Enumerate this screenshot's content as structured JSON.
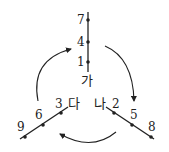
{
  "diagram": {
    "axes": [
      {
        "name": "가",
        "direction": "vertical",
        "points": [
          "7",
          "4",
          "1"
        ]
      },
      {
        "name": "나",
        "direction": "down-right",
        "points": [
          "2",
          "5",
          "8"
        ]
      },
      {
        "name": "다",
        "direction": "down-left",
        "points": [
          "3",
          "6",
          "9"
        ]
      }
    ],
    "arrows": [
      {
        "from": "가",
        "to": "나",
        "label": "clockwise"
      },
      {
        "from": "나",
        "to": "다",
        "label": "clockwise"
      },
      {
        "from": "다",
        "to": "가",
        "label": "clockwise"
      }
    ],
    "colors": {
      "line": "#222222",
      "background": "#ffffff"
    }
  }
}
